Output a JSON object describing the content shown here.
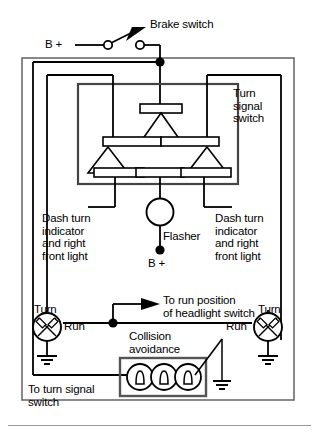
{
  "diagram": {
    "type": "schematic",
    "stroke_color": "#000000",
    "frame_color": "#6b6b6b",
    "background": "#ffffff",
    "labels": {
      "b_plus_top": "B +",
      "brake_switch": "Brake switch",
      "turn_signal_switch": "Turn\nsignal\nswitch",
      "dash_left": "Dash turn\nindicator\nand right\nfront light",
      "dash_right": "Dash turn\nindicator\nand right\nfront light",
      "flasher": "Flasher",
      "b_plus_flasher": "B +",
      "to_run_position": "To run position\nof headlight switch",
      "turn_left": "Turn",
      "run_left": "Run",
      "turn_right": "Turn",
      "run_right": "Run",
      "collision_avoidance": "Collision\navoidance",
      "to_turn_signal_switch": "To turn signal\nswitch"
    },
    "components": [
      {
        "name": "brake-switch",
        "kind": "spst-switch",
        "terminals": 2
      },
      {
        "name": "turn-signal-switch",
        "kind": "multi-contact-switch",
        "contact_bars": 6,
        "wipers": 3
      },
      {
        "name": "flasher",
        "kind": "circle-component"
      },
      {
        "name": "left-turn-lamp",
        "kind": "lamp"
      },
      {
        "name": "right-turn-lamp",
        "kind": "lamp"
      },
      {
        "name": "collision-avoidance-lamps",
        "kind": "lamp-group",
        "count": 3
      },
      {
        "name": "left-lamp-ground",
        "kind": "ground"
      },
      {
        "name": "right-lamp-ground",
        "kind": "ground"
      },
      {
        "name": "collision-ground",
        "kind": "ground"
      }
    ],
    "junction_dots": 4
  }
}
